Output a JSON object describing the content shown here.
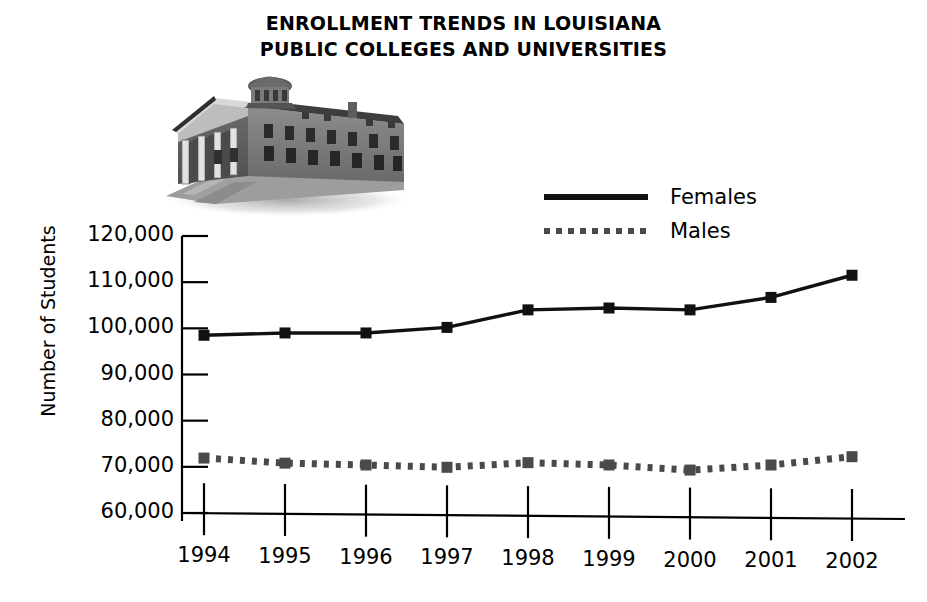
{
  "title": {
    "line1": "ENROLLMENT TRENDS IN LOUISIANA",
    "line2": "PUBLIC COLLEGES AND UNIVERSITIES"
  },
  "illustration": {
    "name": "classical-college-building-engraving",
    "alt": "Historic columned college building with cupola"
  },
  "legend": {
    "position": "upper-right",
    "items": [
      {
        "label": "Females",
        "style": "solid",
        "color": "#111111"
      },
      {
        "label": "Males",
        "style": "dotted",
        "color": "#4a4a4a"
      }
    ]
  },
  "chart_data": {
    "type": "line",
    "title": "ENROLLMENT TRENDS IN LOUISIANA PUBLIC COLLEGES AND UNIVERSITIES",
    "xlabel": "",
    "ylabel": "Number of Students",
    "categories": [
      "1994",
      "1995",
      "1996",
      "1997",
      "1998",
      "1999",
      "2000",
      "2001",
      "2002"
    ],
    "x": [
      1994,
      1995,
      1996,
      1997,
      1998,
      1999,
      2000,
      2001,
      2002
    ],
    "ylim": [
      60000,
      120000
    ],
    "yticks": [
      60000,
      70000,
      80000,
      90000,
      100000,
      110000,
      120000
    ],
    "ytick_labels": [
      "60,000",
      "70,000",
      "80,000",
      "90,000",
      "100,000",
      "110,000",
      "120,000"
    ],
    "grid": false,
    "marker": "square",
    "legend_position": "upper-right",
    "series": [
      {
        "name": "Females",
        "style": "solid",
        "color": "#111111",
        "values": [
          98500,
          99000,
          99000,
          100200,
          104000,
          104400,
          104000,
          106700,
          111500
        ]
      },
      {
        "name": "Males",
        "style": "dotted",
        "color": "#4a4a4a",
        "values": [
          71900,
          70800,
          70400,
          69900,
          70900,
          70400,
          69300,
          70400,
          72200
        ]
      }
    ]
  }
}
